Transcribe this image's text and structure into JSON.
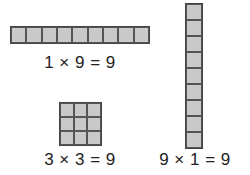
{
  "diagram": {
    "arrays": [
      {
        "id": "horizontal",
        "rows": 1,
        "cols": 9,
        "label": "1 × 9 = 9"
      },
      {
        "id": "square",
        "rows": 3,
        "cols": 3,
        "label": "3 × 3 = 9"
      },
      {
        "id": "vertical",
        "rows": 9,
        "cols": 1,
        "label": "9 × 1 = 9"
      }
    ],
    "colors": {
      "cell_fill": "#c9c9c9",
      "cell_border": "#555555",
      "background": "#ffffff"
    }
  }
}
